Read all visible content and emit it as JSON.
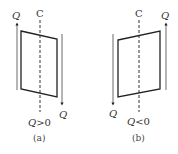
{
  "panels": [
    {
      "id": "a",
      "axis_label": "C",
      "charge_top_label": "Q",
      "charge_bottom_label": "Q",
      "condition_symbol": "Q",
      "condition_op": ">0",
      "caption": "(a)",
      "parallelogram": [
        [
          21,
          31
        ],
        [
          57,
          39
        ],
        [
          57,
          97
        ],
        [
          21,
          89
        ]
      ],
      "axis_x": 40,
      "current_lines": [
        {
          "x": 17,
          "y1": 90,
          "y2": 23,
          "direction": "up"
        },
        {
          "x": 62,
          "y1": 34,
          "y2": 104,
          "direction": "down"
        }
      ]
    },
    {
      "id": "b",
      "axis_label": "C",
      "charge_top_label": "Q",
      "charge_bottom_label": "Q",
      "condition_symbol": "Q",
      "condition_op": "<0",
      "caption": "(b)",
      "parallelogram": [
        [
          118,
          40
        ],
        [
          160,
          31
        ],
        [
          160,
          89
        ],
        [
          118,
          97
        ]
      ],
      "axis_x": 139,
      "current_lines": [
        {
          "x": 166,
          "y1": 90,
          "y2": 23,
          "direction": "up"
        },
        {
          "x": 113,
          "y1": 34,
          "y2": 104,
          "direction": "down"
        }
      ]
    }
  ],
  "colors": {
    "stroke": "#333333",
    "thin_stroke": "#555555"
  }
}
